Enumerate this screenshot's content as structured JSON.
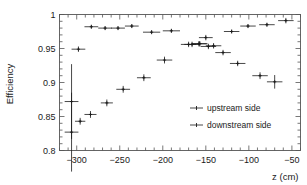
{
  "chart_data": {
    "type": "scatter",
    "title": "",
    "xlabel": "z (cm)",
    "ylabel": "Efficiency",
    "xlim": [
      -320,
      -40
    ],
    "ylim": [
      0.8,
      1.0
    ],
    "grid": false,
    "legend_position": "bottom-right",
    "xticks": [
      -300,
      -250,
      -200,
      -150,
      -100,
      -50
    ],
    "xticklabels": [
      "−300",
      "−250",
      "−200",
      "−150",
      "−100",
      "−50"
    ],
    "yticks": [
      0.8,
      0.85,
      0.9,
      0.95,
      1
    ],
    "yticklabels": [
      "0.8",
      "0.85",
      "0.9",
      "0.95",
      "1"
    ],
    "x_minor_ticks_per_major": 5,
    "y_minor_ticks_per_major": 5,
    "series": [
      {
        "name": "upstream side",
        "marker": "cross-with-errorbars",
        "points": [
          {
            "x": -306,
            "y": 0.872,
            "xerr": 8,
            "yerr": 0.055
          },
          {
            "x": -298,
            "y": 0.949,
            "xerr": 8,
            "yerr": 0.004
          },
          {
            "x": -283,
            "y": 0.982,
            "xerr": 8,
            "yerr": 0.003
          },
          {
            "x": -267,
            "y": 0.98,
            "xerr": 8,
            "yerr": 0.003
          },
          {
            "x": -252,
            "y": 0.98,
            "xerr": 8,
            "yerr": 0.003
          },
          {
            "x": -236,
            "y": 0.983,
            "xerr": 8,
            "yerr": 0.003
          },
          {
            "x": -213,
            "y": 0.974,
            "xerr": 10,
            "yerr": 0.003
          },
          {
            "x": -190,
            "y": 0.976,
            "xerr": 10,
            "yerr": 0.003
          },
          {
            "x": -166,
            "y": 0.956,
            "xerr": 9,
            "yerr": 0.004
          },
          {
            "x": -157,
            "y": 0.957,
            "xerr": 9,
            "yerr": 0.004
          },
          {
            "x": -150,
            "y": 0.966,
            "xerr": 8,
            "yerr": 0.004
          },
          {
            "x": -141,
            "y": 0.954,
            "xerr": 9,
            "yerr": 0.004
          },
          {
            "x": -120,
            "y": 0.975,
            "xerr": 9,
            "yerr": 0.003
          },
          {
            "x": -101,
            "y": 0.983,
            "xerr": 9,
            "yerr": 0.003
          },
          {
            "x": -79,
            "y": 0.985,
            "xerr": 9,
            "yerr": 0.003
          },
          {
            "x": -57,
            "y": 0.991,
            "xerr": 9,
            "yerr": 0.004
          }
        ]
      },
      {
        "name": "downstream side",
        "marker": "cross-with-errorbars",
        "points": [
          {
            "x": -306,
            "y": 0.827,
            "xerr": 8,
            "yerr": 0.058
          },
          {
            "x": -296,
            "y": 0.843,
            "xerr": 6,
            "yerr": 0.005
          },
          {
            "x": -284,
            "y": 0.853,
            "xerr": 7,
            "yerr": 0.005
          },
          {
            "x": -265,
            "y": 0.87,
            "xerr": 7,
            "yerr": 0.005
          },
          {
            "x": -246,
            "y": 0.89,
            "xerr": 8,
            "yerr": 0.005
          },
          {
            "x": -222,
            "y": 0.907,
            "xerr": 8,
            "yerr": 0.005
          },
          {
            "x": -198,
            "y": 0.933,
            "xerr": 9,
            "yerr": 0.005
          },
          {
            "x": -170,
            "y": 0.956,
            "xerr": 9,
            "yerr": 0.004
          },
          {
            "x": -158,
            "y": 0.957,
            "xerr": 9,
            "yerr": 0.004
          },
          {
            "x": -147,
            "y": 0.953,
            "xerr": 9,
            "yerr": 0.004
          },
          {
            "x": -130,
            "y": 0.944,
            "xerr": 9,
            "yerr": 0.004
          },
          {
            "x": -113,
            "y": 0.928,
            "xerr": 9,
            "yerr": 0.004
          },
          {
            "x": -87,
            "y": 0.91,
            "xerr": 9,
            "yerr": 0.005
          },
          {
            "x": -70,
            "y": 0.901,
            "xerr": 9,
            "yerr": 0.01
          }
        ]
      }
    ]
  },
  "legend": {
    "entries": [
      {
        "label": "upstream side"
      },
      {
        "label": "downstream side"
      }
    ]
  }
}
